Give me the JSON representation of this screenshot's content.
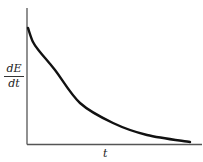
{
  "chart_data": {
    "type": "line",
    "title": "",
    "xlabel": "t",
    "ylabel_numerator": "dE",
    "ylabel_denominator": "dt",
    "ylabel": "dE/dt",
    "grid": false,
    "legend": null,
    "series": [
      {
        "name": "dE/dt",
        "x": [
          0,
          0.07,
          0.3,
          0.5,
          0.7,
          0.95
        ],
        "values": [
          0.85,
          0.7,
          0.3,
          0.16,
          0.07,
          0.02
        ]
      }
    ],
    "pixel_path": [
      [
        28,
        28
      ],
      [
        33,
        42
      ],
      [
        40,
        52
      ],
      [
        55,
        70
      ],
      [
        80,
        103
      ],
      [
        113,
        123
      ],
      [
        147,
        135
      ],
      [
        190,
        142
      ]
    ]
  }
}
